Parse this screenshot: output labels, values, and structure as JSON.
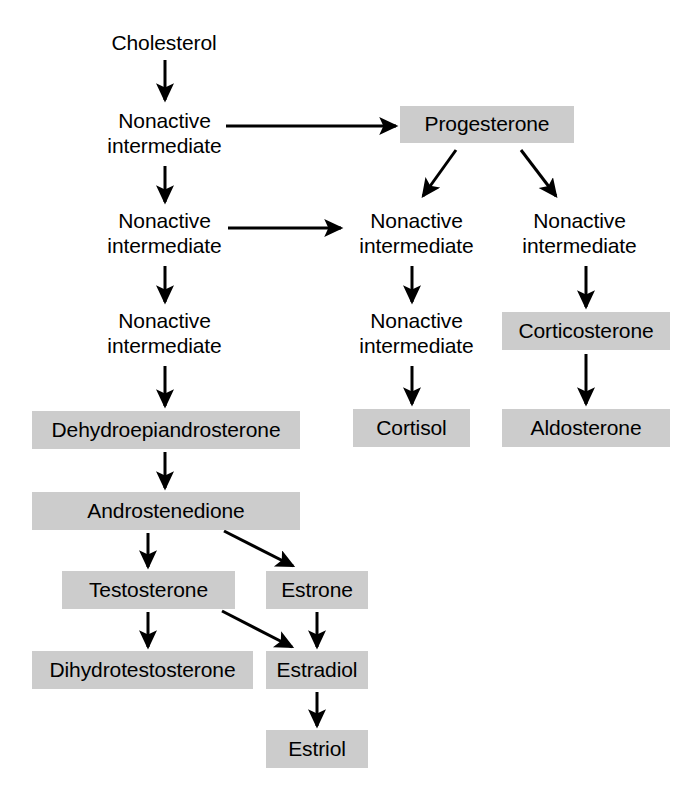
{
  "diagram": {
    "colors": {
      "hormone_box_fill": "#cccccc",
      "text": "#000000",
      "arrow": "#000000",
      "background": "#ffffff"
    },
    "nodes": [
      {
        "id": "cholesterol",
        "label": "Cholesterol",
        "type": "precursor",
        "x": 103,
        "y": 28,
        "w": 122,
        "h": 30
      },
      {
        "id": "nonactive-1",
        "label": "Nonactive\nintermediate",
        "type": "intermediate",
        "x": 93,
        "y": 108,
        "w": 143,
        "h": 52
      },
      {
        "id": "progesterone",
        "label": "Progesterone",
        "type": "hormone",
        "x": 400,
        "y": 106,
        "w": 174,
        "h": 37
      },
      {
        "id": "nonactive-2",
        "label": "Nonactive\nintermediate",
        "type": "intermediate",
        "x": 93,
        "y": 208,
        "w": 143,
        "h": 52
      },
      {
        "id": "nonactive-3",
        "label": "Nonactive\nintermediate",
        "type": "intermediate",
        "x": 345,
        "y": 208,
        "w": 143,
        "h": 52
      },
      {
        "id": "nonactive-4",
        "label": "Nonactive\nintermediate",
        "type": "intermediate",
        "x": 508,
        "y": 208,
        "w": 143,
        "h": 52
      },
      {
        "id": "nonactive-5",
        "label": "Nonactive\nintermediate",
        "type": "intermediate",
        "x": 93,
        "y": 308,
        "w": 143,
        "h": 52
      },
      {
        "id": "nonactive-6",
        "label": "Nonactive\nintermediate",
        "type": "intermediate",
        "x": 345,
        "y": 308,
        "w": 143,
        "h": 52
      },
      {
        "id": "corticosterone",
        "label": "Corticosterone",
        "type": "hormone",
        "x": 502,
        "y": 312,
        "w": 168,
        "h": 38
      },
      {
        "id": "dehydroepiandrosterone",
        "label": "Dehydroepiandrosterone",
        "type": "hormone",
        "x": 32,
        "y": 411,
        "w": 268,
        "h": 38
      },
      {
        "id": "cortisol",
        "label": "Cortisol",
        "type": "hormone",
        "x": 353,
        "y": 409,
        "w": 117,
        "h": 38
      },
      {
        "id": "aldosterone",
        "label": "Aldosterone",
        "type": "hormone",
        "x": 502,
        "y": 409,
        "w": 168,
        "h": 38
      },
      {
        "id": "androstenedione",
        "label": "Androstenedione",
        "type": "hormone",
        "x": 32,
        "y": 492,
        "w": 268,
        "h": 38
      },
      {
        "id": "testosterone",
        "label": "Testosterone",
        "type": "hormone",
        "x": 62,
        "y": 571,
        "w": 173,
        "h": 38
      },
      {
        "id": "estrone",
        "label": "Estrone",
        "type": "hormone",
        "x": 266,
        "y": 571,
        "w": 102,
        "h": 38
      },
      {
        "id": "dihydrotestosterone",
        "label": "Dihydrotestosterone",
        "type": "hormone",
        "x": 32,
        "y": 651,
        "w": 221,
        "h": 38
      },
      {
        "id": "estradiol",
        "label": "Estradiol",
        "type": "hormone",
        "x": 266,
        "y": 651,
        "w": 102,
        "h": 38
      },
      {
        "id": "estriol",
        "label": "Estriol",
        "type": "hormone",
        "x": 266,
        "y": 730,
        "w": 102,
        "h": 38
      }
    ],
    "arrows": [
      {
        "id": "cholesterol-to-nonactive-1",
        "from": "cholesterol",
        "to": "nonactive-1",
        "x1": 165,
        "y1": 60,
        "x2": 165,
        "y2": 100
      },
      {
        "id": "nonactive-1-to-progesterone",
        "from": "nonactive-1",
        "to": "progesterone",
        "x1": 226,
        "y1": 126,
        "x2": 396,
        "y2": 126
      },
      {
        "id": "nonactive-1-to-nonactive-2",
        "from": "nonactive-1",
        "to": "nonactive-2",
        "x1": 165,
        "y1": 166,
        "x2": 165,
        "y2": 202
      },
      {
        "id": "progesterone-to-nonactive-3",
        "from": "progesterone",
        "to": "nonactive-3",
        "x1": 456,
        "y1": 150,
        "x2": 423,
        "y2": 196
      },
      {
        "id": "progesterone-to-nonactive-4",
        "from": "progesterone",
        "to": "nonactive-4",
        "x1": 521,
        "y1": 150,
        "x2": 556,
        "y2": 196
      },
      {
        "id": "nonactive-2-to-nonactive-3",
        "from": "nonactive-2",
        "to": "nonactive-3",
        "x1": 228,
        "y1": 228,
        "x2": 341,
        "y2": 228
      },
      {
        "id": "nonactive-2-to-nonactive-5",
        "from": "nonactive-2",
        "to": "nonactive-5",
        "x1": 165,
        "y1": 266,
        "x2": 165,
        "y2": 302
      },
      {
        "id": "nonactive-3-to-nonactive-6",
        "from": "nonactive-3",
        "to": "nonactive-6",
        "x1": 412,
        "y1": 266,
        "x2": 412,
        "y2": 302
      },
      {
        "id": "nonactive-4-to-corticosterone",
        "from": "nonactive-4",
        "to": "corticosterone",
        "x1": 586,
        "y1": 266,
        "x2": 586,
        "y2": 307
      },
      {
        "id": "nonactive-5-to-dehydroepiandrosterone",
        "from": "nonactive-5",
        "to": "dehydroepiandrosterone",
        "x1": 165,
        "y1": 366,
        "x2": 165,
        "y2": 406
      },
      {
        "id": "nonactive-6-to-cortisol",
        "from": "nonactive-6",
        "to": "cortisol",
        "x1": 412,
        "y1": 366,
        "x2": 412,
        "y2": 404
      },
      {
        "id": "corticosterone-to-aldosterone",
        "from": "corticosterone",
        "to": "aldosterone",
        "x1": 586,
        "y1": 354,
        "x2": 586,
        "y2": 404
      },
      {
        "id": "dehydroepiandrosterone-to-androstenedione",
        "from": "dehydroepiandrosterone",
        "to": "androstenedione",
        "x1": 165,
        "y1": 452,
        "x2": 165,
        "y2": 488
      },
      {
        "id": "androstenedione-to-testosterone",
        "from": "androstenedione",
        "to": "testosterone",
        "x1": 148,
        "y1": 533,
        "x2": 148,
        "y2": 567
      },
      {
        "id": "androstenedione-to-estrone",
        "from": "androstenedione",
        "to": "estrone",
        "x1": 224,
        "y1": 531,
        "x2": 293,
        "y2": 566
      },
      {
        "id": "testosterone-to-dihydrotestosterone",
        "from": "testosterone",
        "to": "dihydrotestosterone",
        "x1": 148,
        "y1": 612,
        "x2": 148,
        "y2": 647
      },
      {
        "id": "testosterone-to-estradiol",
        "from": "testosterone",
        "to": "estradiol",
        "x1": 222,
        "y1": 611,
        "x2": 292,
        "y2": 647
      },
      {
        "id": "estrone-to-estradiol",
        "from": "estrone",
        "to": "estradiol",
        "x1": 317,
        "y1": 612,
        "x2": 317,
        "y2": 647
      },
      {
        "id": "estradiol-to-estriol",
        "from": "estradiol",
        "to": "estriol",
        "x1": 317,
        "y1": 692,
        "x2": 317,
        "y2": 726
      }
    ]
  }
}
